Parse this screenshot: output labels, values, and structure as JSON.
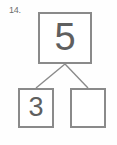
{
  "problem": {
    "number_label": "14.",
    "type": "number-bond",
    "whole": {
      "value": "5",
      "filled": true
    },
    "parts": [
      {
        "position": "left",
        "value": "3",
        "filled": true
      },
      {
        "position": "right",
        "value": "",
        "filled": false
      }
    ]
  },
  "style": {
    "box_border_color": "#8a8a8a",
    "connector_color": "#8a8a8a",
    "digit_color": "#5f5f5f",
    "label_color": "#6e6e6e",
    "background_color": "#fefefe"
  }
}
